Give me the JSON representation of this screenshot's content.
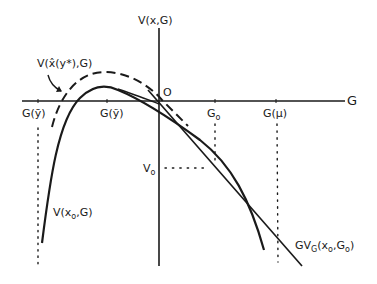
{
  "diagram": {
    "axes": {
      "y_label": "V(x,G)",
      "x_label": "G",
      "origin_label": "O"
    },
    "x_ticks": [
      {
        "label": "G(ȳ)"
      },
      {
        "label": "G(ỹ)"
      },
      {
        "label_main": "G",
        "label_sub": "o"
      },
      {
        "label": "G(μ)"
      }
    ],
    "y_ticks": [
      {
        "label_main": "V",
        "label_sub": "o"
      }
    ],
    "curves": {
      "dashed": {
        "label": "V(x̂(y*),G)"
      },
      "solid": {
        "label_main": "V(x",
        "label_sub": "o",
        "label_end": ",G)"
      },
      "tangent": {
        "label_main": "GV",
        "label_sub": "G",
        "label_mid": "(x",
        "label_sub2": "o",
        "label_mid2": ",G",
        "label_sub3": "o",
        "label_end": ")"
      }
    },
    "colors": {
      "ink": "#1a1a1a",
      "background": "#ffffff"
    }
  }
}
